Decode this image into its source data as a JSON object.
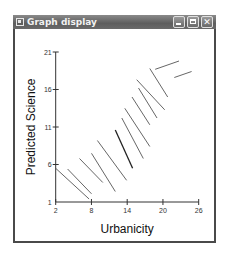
{
  "window": {
    "title": "Graph display",
    "buttons": {
      "minimize": "minimize",
      "maximize": "maximize",
      "close": "✕"
    }
  },
  "chart_data": {
    "type": "line",
    "title": "",
    "xlabel": "Urbanicity",
    "ylabel": "Predicted Science",
    "xlim": [
      2,
      26
    ],
    "ylim": [
      1,
      21
    ],
    "xticks": [
      2,
      8,
      14,
      20,
      26
    ],
    "yticks": [
      1,
      6,
      11,
      16,
      21
    ],
    "grid": false,
    "legend": "none",
    "line_color": "#555555",
    "series": [
      {
        "name": "segment-1",
        "x": [
          2.0,
          7.6
        ],
        "y": [
          5.5,
          1.4
        ]
      },
      {
        "name": "segment-2",
        "x": [
          4.0,
          8.0
        ],
        "y": [
          5.4,
          2.1
        ]
      },
      {
        "name": "segment-3",
        "x": [
          6.0,
          9.9
        ],
        "y": [
          6.8,
          3.6
        ]
      },
      {
        "name": "segment-4",
        "x": [
          8.0,
          12.0
        ],
        "y": [
          7.5,
          2.4
        ]
      },
      {
        "name": "segment-5",
        "x": [
          9.0,
          13.9
        ],
        "y": [
          9.2,
          3.9
        ]
      },
      {
        "name": "segment-6",
        "x": [
          12.0,
          14.9
        ],
        "y": [
          10.6,
          5.5
        ]
      },
      {
        "name": "segment-7",
        "x": [
          13.1,
          16.7
        ],
        "y": [
          12.2,
          6.8
        ]
      },
      {
        "name": "segment-8",
        "x": [
          13.6,
          17.8
        ],
        "y": [
          13.5,
          8.4
        ]
      },
      {
        "name": "segment-9",
        "x": [
          14.8,
          17.8
        ],
        "y": [
          15.0,
          11.3
        ]
      },
      {
        "name": "segment-10",
        "x": [
          15.9,
          19.0
        ],
        "y": [
          16.2,
          12.2
        ]
      },
      {
        "name": "segment-11",
        "x": [
          15.6,
          20.3
        ],
        "y": [
          17.3,
          13.3
        ]
      },
      {
        "name": "segment-12",
        "x": [
          17.8,
          20.8
        ],
        "y": [
          18.8,
          15.0
        ]
      },
      {
        "name": "segment-13",
        "x": [
          18.7,
          22.7
        ],
        "y": [
          18.7,
          19.8
        ]
      },
      {
        "name": "segment-14",
        "x": [
          21.9,
          24.8
        ],
        "y": [
          17.6,
          18.4
        ]
      }
    ],
    "emphasized_series": [
      "segment-6"
    ]
  }
}
